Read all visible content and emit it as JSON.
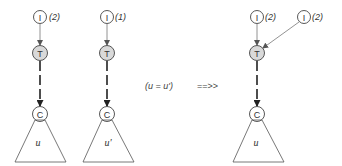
{
  "diagram": {
    "colors": {
      "stroke": "#444444",
      "thin_edge": "#777777",
      "t_fill": "#d9d9d9",
      "background": "#ffffff"
    },
    "left_tree": {
      "i_node": {
        "label": "I",
        "count": "(2)"
      },
      "t_node": {
        "label": "T"
      },
      "c_node": {
        "label": "C"
      },
      "subtree_label": "u"
    },
    "middle_tree": {
      "i_node": {
        "label": "I",
        "count": "(1)"
      },
      "t_node": {
        "label": "T"
      },
      "c_node": {
        "label": "C"
      },
      "subtree_label": "u'"
    },
    "condition": "(u = u')",
    "transform_arrow": "==>>",
    "right_tree": {
      "i_node_1": {
        "label": "I",
        "count": "(2)"
      },
      "i_node_2": {
        "label": "I",
        "count": "(2)"
      },
      "t_node": {
        "label": "T"
      },
      "c_node": {
        "label": "C"
      },
      "subtree_label": "u"
    }
  }
}
